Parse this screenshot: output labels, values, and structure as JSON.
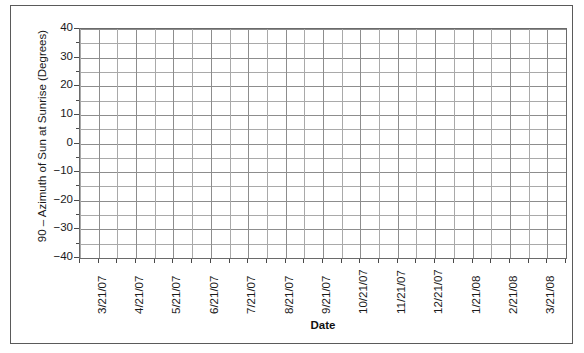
{
  "chart_data": {
    "type": "line",
    "title": "",
    "xlabel": "Date",
    "ylabel": "90 – Azimuth of Sun at Sunrise (Degrees)",
    "ylim": [
      -40,
      40
    ],
    "y_major_step": 10,
    "y_minor_step": 5,
    "y_ticks": [
      40,
      30,
      20,
      10,
      0,
      -10,
      -20,
      -30,
      -40
    ],
    "y_tick_labels": [
      "40",
      "30",
      "20",
      "10",
      "0",
      "−10",
      "−20",
      "−30",
      "−40"
    ],
    "x_tick_labels": [
      "3/21/07",
      "4/21/07",
      "5/21/07",
      "6/21/07",
      "7/21/07",
      "8/21/07",
      "9/21/07",
      "10/21/07",
      "11/21/07",
      "12/21/07",
      "1/21/08",
      "2/21/08",
      "3/21/08"
    ],
    "x_minor_divisions_per_label": 2,
    "grid": true,
    "legend": false,
    "series": [],
    "values": [],
    "categories": [],
    "note": "Empty plot grid — no data plotted"
  },
  "axes": {
    "y_title": "90 – Azimuth of Sun at Sunrise (Degrees)",
    "x_title": "Date"
  },
  "colors": {
    "frame": "#5a5a5a",
    "plot_border": "#6a6a6a",
    "grid_major": "#8d8d8d",
    "grid_minor": "#a9a9a9",
    "text": "#1a1a1a",
    "background": "#ffffff"
  }
}
